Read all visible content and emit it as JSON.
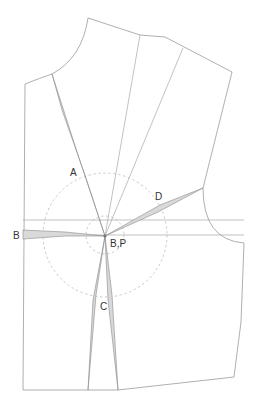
{
  "diagram": {
    "type": "bodice-pattern-dart-manipulation",
    "labels": {
      "dart_a": "A",
      "dart_b": "B",
      "dart_c": "C",
      "dart_d": "D",
      "apex": "B,P"
    },
    "colors": {
      "outline": "#9a9a9a",
      "dart_fill": "#d9d9d9",
      "dashed_circle": "#bdbdbd",
      "label": "#333333"
    }
  }
}
